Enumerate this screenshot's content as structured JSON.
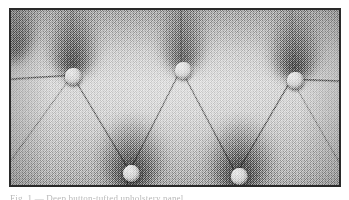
{
  "page": {
    "background_color": "#ffffff",
    "caption_partial_text": "Fig. 1 — Deep button-tufted upholstery panel"
  },
  "plate": {
    "name": "tufted-upholstery-photograph",
    "description": "Halftone photograph of a deep button-tufted (Chesterfield) upholstered panel",
    "frame_color": "#2a2a2a",
    "frame_border_width_px": 2,
    "x": 9,
    "y": 8,
    "width": 332,
    "height": 179,
    "media": "scanned halftone print",
    "tone": {
      "highlight_color": "#dcdcdc",
      "midtone_color": "#c2c2c2",
      "shadow_color": "#7c7c7c",
      "deep_shadow_color": "#5a5a5a"
    },
    "buttons": [
      {
        "label": "tuft-button-upper-left",
        "x": 62,
        "y": 66,
        "diameter": 17
      },
      {
        "label": "tuft-button-upper-center",
        "x": 172,
        "y": 60,
        "diameter": 17
      },
      {
        "label": "tuft-button-upper-right",
        "x": 284,
        "y": 70,
        "diameter": 17
      },
      {
        "label": "tuft-button-lower-left",
        "x": 120,
        "y": 163,
        "diameter": 17
      },
      {
        "label": "tuft-button-lower-right",
        "x": 228,
        "y": 166,
        "diameter": 17
      }
    ],
    "shadow_funnels": [
      {
        "label": "funnel-upper-left",
        "x": 62,
        "y": 22,
        "width": 56,
        "height": 58
      },
      {
        "label": "funnel-upper-center",
        "x": 172,
        "y": 16,
        "width": 52,
        "height": 56
      },
      {
        "label": "funnel-upper-right",
        "x": 284,
        "y": 26,
        "width": 58,
        "height": 58
      },
      {
        "label": "funnel-lower-left",
        "x": 120,
        "y": 132,
        "width": 66,
        "height": 62
      },
      {
        "label": "funnel-lower-right",
        "x": 228,
        "y": 134,
        "width": 66,
        "height": 62
      }
    ],
    "seams": [
      {
        "label": "seam-left-edge-to-upper-left-button",
        "x1": 0,
        "y1": 70,
        "x2": 62,
        "y2": 66
      },
      {
        "label": "seam-upper-left-button-to-lower-left-button",
        "x1": 62,
        "y1": 66,
        "x2": 120,
        "y2": 163
      },
      {
        "label": "seam-upper-center-button-to-lower-left-button",
        "x1": 172,
        "y1": 60,
        "x2": 120,
        "y2": 163
      },
      {
        "label": "seam-upper-center-button-to-lower-right-button",
        "x1": 172,
        "y1": 60,
        "x2": 228,
        "y2": 166
      },
      {
        "label": "seam-upper-right-button-to-lower-right-button",
        "x1": 284,
        "y1": 70,
        "x2": 228,
        "y2": 166
      },
      {
        "label": "seam-upper-right-button-to-right-edge",
        "x1": 284,
        "y1": 70,
        "x2": 332,
        "y2": 72
      },
      {
        "label": "seam-top-edge-to-upper-center-button",
        "x1": 172,
        "y1": 0,
        "x2": 172,
        "y2": 60
      },
      {
        "label": "seam-lower-left-button-to-bottom-edge",
        "x1": 120,
        "y1": 163,
        "x2": 118,
        "y2": 179
      },
      {
        "label": "seam-lower-right-button-to-bottom-edge",
        "x1": 228,
        "y1": 166,
        "x2": 230,
        "y2": 179
      },
      {
        "label": "seam-left-edge-lower-diagonal",
        "x1": 0,
        "y1": 150,
        "x2": 62,
        "y2": 66
      },
      {
        "label": "seam-right-edge-lower-diagonal",
        "x1": 332,
        "y1": 152,
        "x2": 284,
        "y2": 70
      }
    ]
  }
}
